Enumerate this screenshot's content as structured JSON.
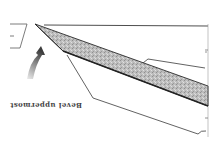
{
  "diagram": {
    "caption": "Bevel uppermost",
    "orientation": "rotated 180 degrees",
    "colors": {
      "line": "#3a3a3a",
      "blade_fill": "#b8b8b8",
      "arrow_dark": "#3c3c3c",
      "arrow_light": "#e8e8e8",
      "background": "#ffffff"
    },
    "parts": [
      "blade",
      "bevel",
      "holder-outline",
      "direction-arrow",
      "left-bracket",
      "right-edge-ticks"
    ]
  }
}
